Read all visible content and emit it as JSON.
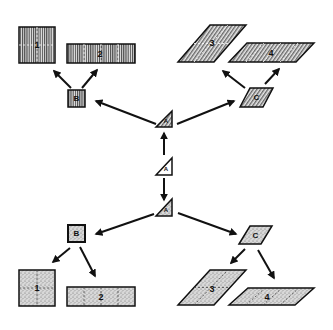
{
  "diagram": {
    "title": "",
    "center": {
      "label": "A",
      "shape": "triangle",
      "fill": "plain"
    },
    "top_branch": {
      "fill": "hatched",
      "apex": {
        "label": "A",
        "shape": "triangle"
      },
      "left_node": {
        "label": "B",
        "shape": "square"
      },
      "right_node": {
        "label": "C",
        "shape": "parallelogram"
      },
      "left_children": [
        {
          "label": "1",
          "shape": "square",
          "divisions": "quartered"
        },
        {
          "label": "2",
          "shape": "rectangle",
          "divisions": "four strips"
        }
      ],
      "right_children": [
        {
          "label": "3",
          "shape": "parallelogram",
          "divisions": "quartered"
        },
        {
          "label": "4",
          "shape": "parallelogram",
          "divisions": "four strips"
        }
      ]
    },
    "bottom_branch": {
      "fill": "stippled",
      "apex": {
        "label": "A",
        "shape": "triangle"
      },
      "left_node": {
        "label": "B",
        "shape": "square"
      },
      "right_node": {
        "label": "C",
        "shape": "parallelogram"
      },
      "left_children": [
        {
          "label": "1",
          "shape": "square",
          "divisions": "quartered"
        },
        {
          "label": "2",
          "shape": "rectangle",
          "divisions": "four strips"
        }
      ],
      "right_children": [
        {
          "label": "3",
          "shape": "parallelogram",
          "divisions": "quartered"
        },
        {
          "label": "4",
          "shape": "parallelogram",
          "divisions": "four strips"
        }
      ]
    },
    "colors": {
      "ink": "#111111",
      "hatch": "#333333",
      "stipple_bg": "#d6d6d6",
      "background": "#ffffff"
    }
  }
}
